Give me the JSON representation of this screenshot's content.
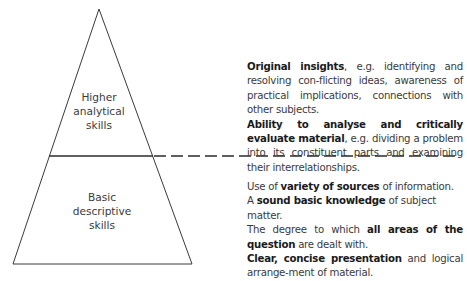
{
  "pyramid": {
    "upper_label": [
      "Higher",
      "analytical",
      "skills"
    ],
    "lower_label": [
      "Basic",
      "descriptive",
      "skills"
    ],
    "line_color": "#3a3a3a"
  },
  "higher_skills": {
    "items": [
      {
        "bold": "Original insights",
        "text": ", e.g. identifying and resolving con-flicting ideas, awareness of practical implications, connections with other subjects."
      },
      {
        "bold": "Ability to analyse and critically evaluate material",
        "text": ", e.g. dividing a problem into its constituent parts and examining their interrelationships."
      }
    ]
  },
  "basic_skills": {
    "items": [
      {
        "pre": "Use of ",
        "bold": "variety of sources",
        "post": " of information."
      },
      {
        "pre": "A ",
        "bold": "sound basic knowledge",
        "post": " of subject matter."
      },
      {
        "pre": "The degree to which ",
        "bold": "all areas of the question",
        "post": " are dealt with."
      },
      {
        "pre": "",
        "bold": "Clear, concise presentation",
        "post": " and logical arrange-ment of material."
      }
    ]
  }
}
